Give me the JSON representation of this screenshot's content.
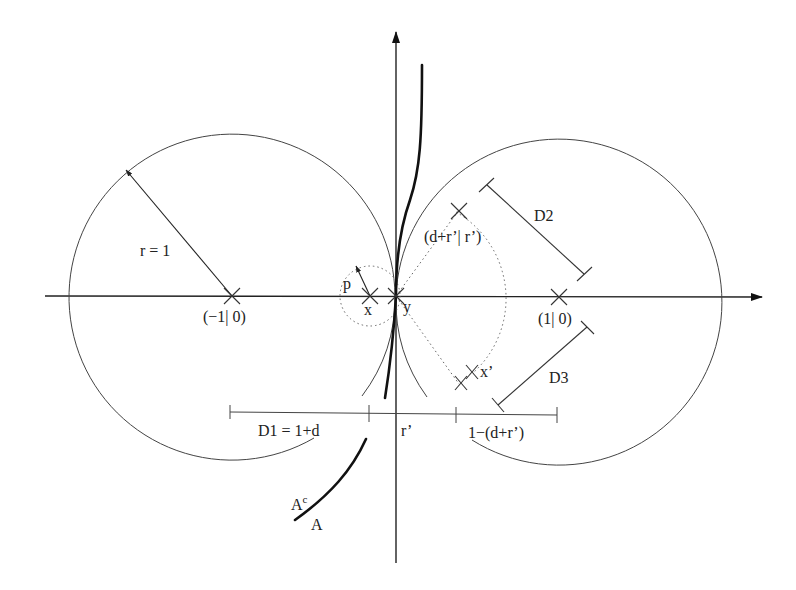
{
  "figure": {
    "type": "geometric-diagram"
  },
  "points": {
    "left_center": "(−1| 0)",
    "right_center": "(1| 0)",
    "x": "x",
    "y": "y",
    "x_prime": "x’",
    "upper_point": "(d+r’| r’)"
  },
  "labels": {
    "radius": "r = 1",
    "p": "p",
    "D1": "D1 = 1+d",
    "r_prime": "r’",
    "third_segment": "1−(d+r’)",
    "D2": "D2",
    "D3": "D3",
    "A_complement": "A",
    "A_complement_sup": "c",
    "A": "A"
  },
  "colors": {
    "ink": "#222222",
    "background": "#ffffff"
  }
}
